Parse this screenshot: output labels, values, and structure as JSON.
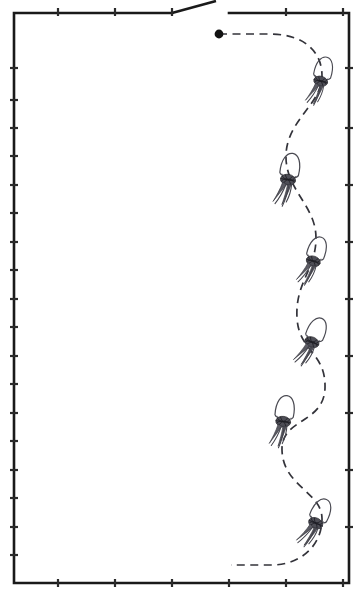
{
  "figure": {
    "type": "line-drawing",
    "width": 364,
    "height": 596,
    "background_color": "#ffffff"
  },
  "frame": {
    "name": "field-boundary",
    "stroke_color": "#1a1a1a",
    "stroke_width": 2.6,
    "left": 14,
    "top": 12,
    "right": 349,
    "bottom": 583,
    "notch": {
      "description": "top border interrupted by upward diagonal and gap",
      "break_start_x": 172,
      "diagonal_apex_x": 216,
      "diagonal_apex_y": 0,
      "resume_x": 229
    },
    "ticks": {
      "stroke_color": "#2a2a2a",
      "left_edge_y": [
        68,
        100,
        128,
        156,
        185,
        213,
        242,
        270,
        299,
        327,
        356,
        384,
        413,
        441,
        470,
        498,
        527,
        555
      ],
      "right_edge_y": [
        68,
        128,
        185,
        242,
        299,
        356,
        413,
        470,
        527
      ],
      "top_edge_x": [
        58,
        115,
        172,
        286,
        343
      ],
      "bottom_edge_x": [
        58,
        115,
        172,
        229,
        286,
        343
      ]
    }
  },
  "path": {
    "name": "dashed-trajectory",
    "stroke_color": "#33333a",
    "stroke_width": 1.7,
    "dash_length": 8,
    "gap_length": 5.5,
    "start_point": {
      "x": 219,
      "y": 34,
      "marker": "filled-dot",
      "radius": 4.4
    },
    "end_point": {
      "x": 231,
      "y": 564,
      "marker": "none"
    },
    "shape": "serpentine S-curve descending along right side",
    "geometry": "M219,34 L272,34 C305,35 322,52 322,76 C322,104 287,120 286,155 C285,190 316,205 316,238 C316,270 295,282 297,318 C299,352 326,352 325,388 C324,424 281,418 282,450 C283,487 323,492 322,520 C321,549 297,565 272,565 L231,565"
  },
  "motifs": {
    "name": "balloon-marker",
    "count": 6,
    "description": "oval canopy with dark knotted center and tapering tail, attached along path",
    "canopy_color": "#4a4a52",
    "knot_color": "#4e4e56",
    "tail_color": "#44444c",
    "items": [
      {
        "index": 1,
        "x": 322,
        "y": 76,
        "rotation": 14,
        "scale": 1.0
      },
      {
        "index": 2,
        "x": 289,
        "y": 174,
        "rotation": 10,
        "scale": 1.08
      },
      {
        "index": 3,
        "x": 315,
        "y": 256,
        "rotation": 18,
        "scale": 1.02
      },
      {
        "index": 4,
        "x": 314,
        "y": 337,
        "rotation": 22,
        "scale": 1.04
      },
      {
        "index": 5,
        "x": 284,
        "y": 416,
        "rotation": 8,
        "scale": 1.06
      },
      {
        "index": 6,
        "x": 318,
        "y": 518,
        "rotation": 24,
        "scale": 1.05
      }
    ]
  },
  "legend": {
    "visible": false,
    "entries": []
  },
  "annotations": {
    "text_labels": [],
    "note": "No visible text in figure"
  }
}
